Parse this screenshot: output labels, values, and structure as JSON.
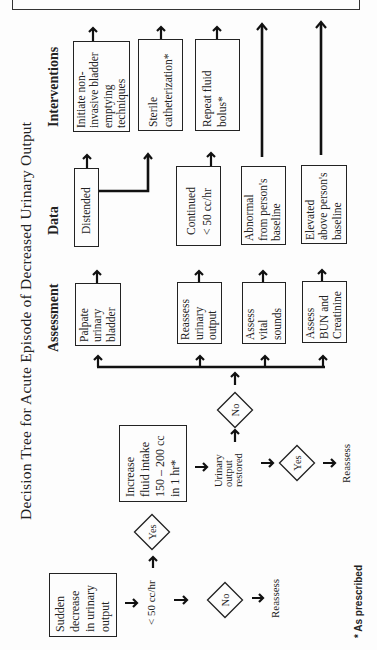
{
  "title": "Decision Tree for Acute Episode of Decreased Urinary Output",
  "columns": {
    "assessment": "Assessment",
    "data": "Data",
    "interventions": "Interventions"
  },
  "start": {
    "box": [
      "Sudden",
      "decrease",
      "in urinary",
      "output"
    ],
    "condition": "< 50 cc/hr"
  },
  "branch_no_1": {
    "decision": "No",
    "result": "Reassess"
  },
  "branch_yes_1": {
    "decision": "Yes",
    "action": [
      "Increase",
      "fluid intake",
      "150 – 200 cc",
      "in 1 hr*"
    ]
  },
  "check": [
    "Urinary",
    "output",
    "restored"
  ],
  "branch_yes_2": {
    "decision": "Yes",
    "result": "Reassess"
  },
  "branch_no_2": {
    "decision": "No"
  },
  "assessments": [
    {
      "lines": [
        "Palpate",
        "urinary",
        "bladder"
      ]
    },
    {
      "lines": [
        "Reassess",
        "urinary",
        "output"
      ]
    },
    {
      "lines": [
        "Assess",
        "vital",
        "sounds"
      ]
    },
    {
      "lines": [
        "Assess",
        "BUN and",
        "Creatinine"
      ]
    }
  ],
  "data": [
    {
      "lines": [
        "Distended"
      ]
    },
    {
      "lines": [
        "Continued",
        "< 50 cc/hr"
      ]
    },
    {
      "lines": [
        "Abnormal",
        "from person's",
        "baseline"
      ]
    },
    {
      "lines": [
        "Elevated",
        "above person's",
        "baseline"
      ]
    }
  ],
  "interventions": [
    {
      "lines": [
        "Initiate non-",
        "invasive bladder",
        "emptying",
        "techniques"
      ]
    },
    {
      "lines": [
        "Sterile",
        "catheterization*"
      ]
    },
    {
      "lines": [
        "Repeat fluid",
        "bolus*"
      ]
    }
  ],
  "footnote": "* As prescribed"
}
